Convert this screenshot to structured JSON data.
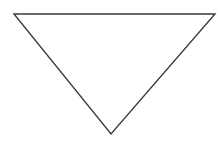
{
  "diagram": {
    "shape": "inverted-triangle",
    "vertices": {
      "top_left": [
        14,
        14
      ],
      "top_right": [
        215,
        14
      ],
      "bottom": [
        111,
        134
      ]
    },
    "stroke_color": "#3a3a3a",
    "stroke_width": 1.4,
    "fill_color": "#ffffff",
    "background_color": "#ffffff"
  }
}
